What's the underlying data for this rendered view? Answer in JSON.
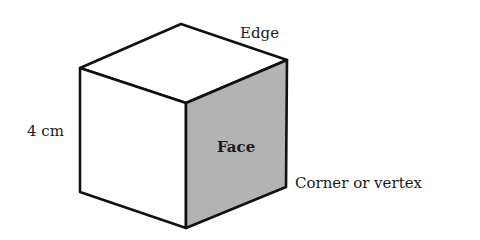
{
  "diagram": {
    "type": "labeled-cube",
    "labels": {
      "edge": "Edge",
      "side_length": "4 cm",
      "face": "Face",
      "vertex": "Corner or vertex"
    },
    "colors": {
      "stroke": "#111111",
      "shaded_face": "#b3b3b3",
      "unshaded_face": "#ffffff"
    }
  }
}
